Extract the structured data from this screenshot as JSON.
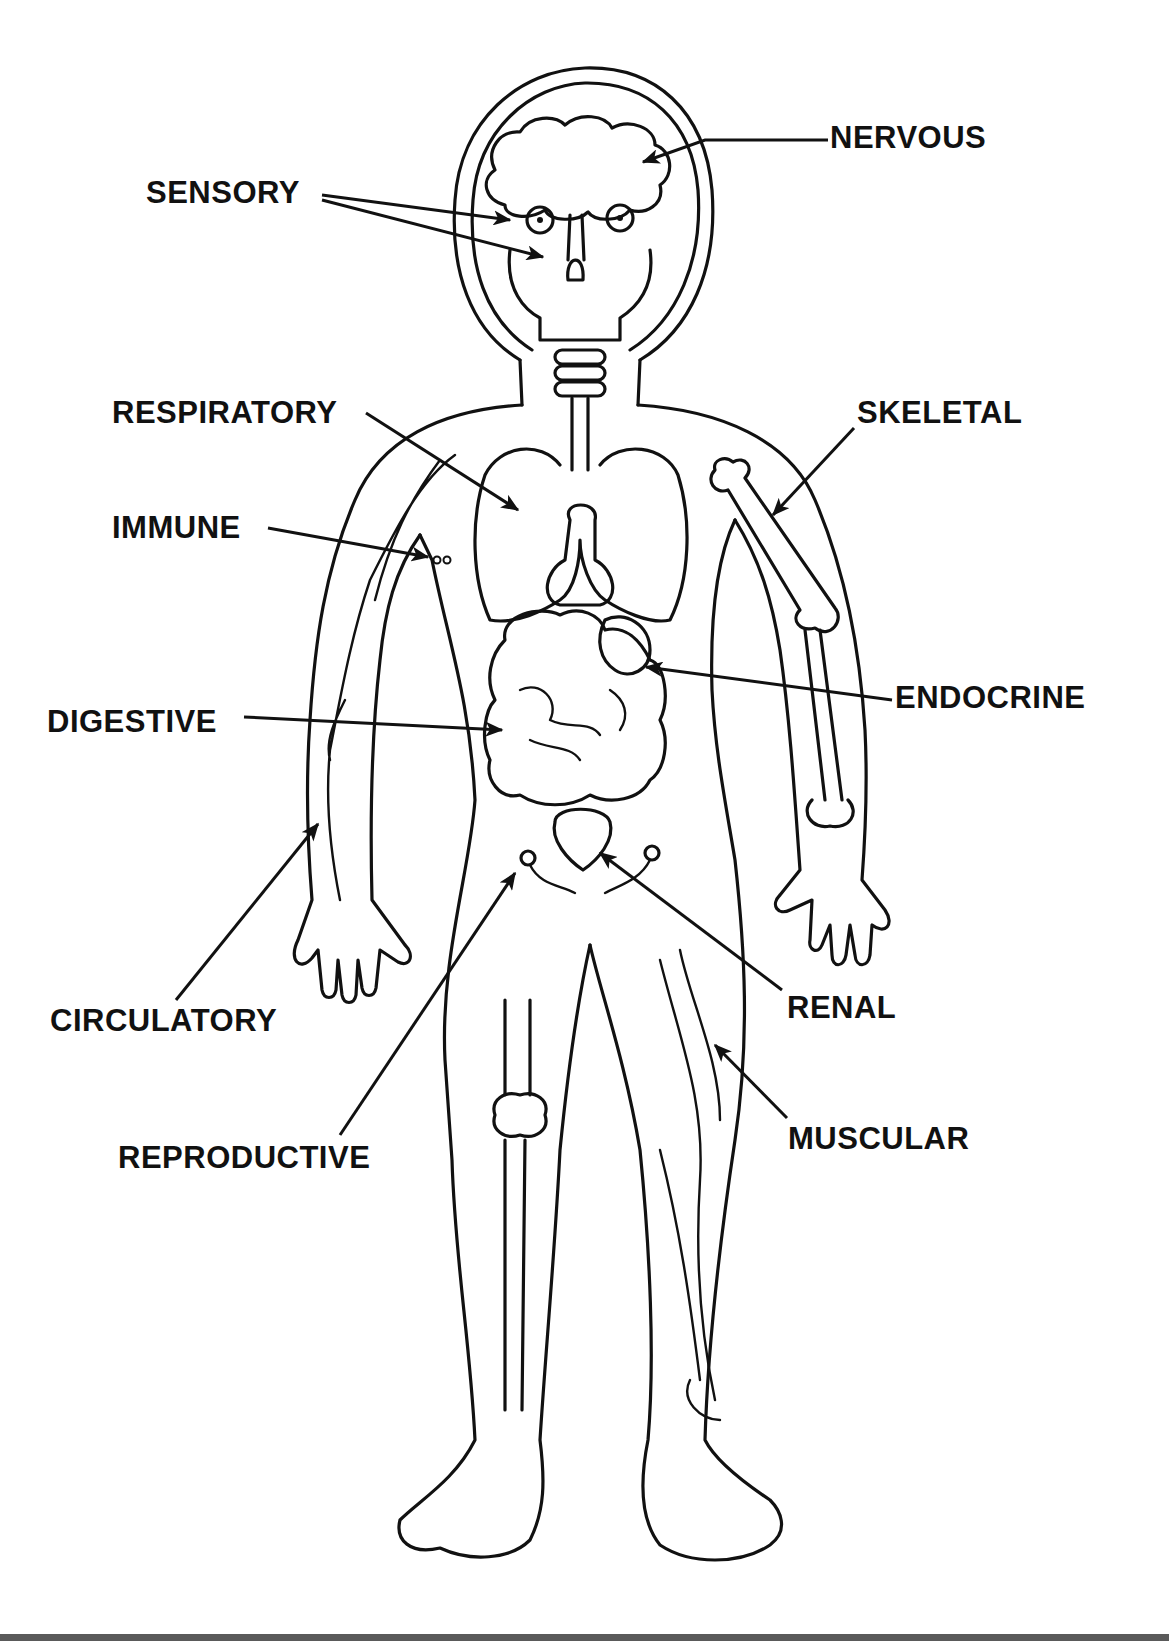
{
  "diagram": {
    "labels": [
      {
        "id": "nervous",
        "text": "NERVOUS",
        "x": 830,
        "y": 122
      },
      {
        "id": "sensory",
        "text": "SENSORY",
        "x": 146,
        "y": 177
      },
      {
        "id": "respiratory",
        "text": "RESPIRATORY",
        "x": 112,
        "y": 397
      },
      {
        "id": "skeletal",
        "text": "SKELETAL",
        "x": 857,
        "y": 397
      },
      {
        "id": "immune",
        "text": "IMMUNE",
        "x": 112,
        "y": 512
      },
      {
        "id": "endocrine",
        "text": "ENDOCRINE",
        "x": 895,
        "y": 682
      },
      {
        "id": "digestive",
        "text": "DIGESTIVE",
        "x": 47,
        "y": 706
      },
      {
        "id": "circulatory",
        "text": "CIRCULATORY",
        "x": 50,
        "y": 1005
      },
      {
        "id": "renal",
        "text": "RENAL",
        "x": 787,
        "y": 992
      },
      {
        "id": "reproductive",
        "text": "REPRODUCTIVE",
        "x": 118,
        "y": 1142
      },
      {
        "id": "muscular",
        "text": "MUSCULAR",
        "x": 788,
        "y": 1123
      }
    ],
    "colors": {
      "ink": "#111111",
      "background": "#ffffff",
      "bottom_bar": "#5a5a5a"
    }
  }
}
